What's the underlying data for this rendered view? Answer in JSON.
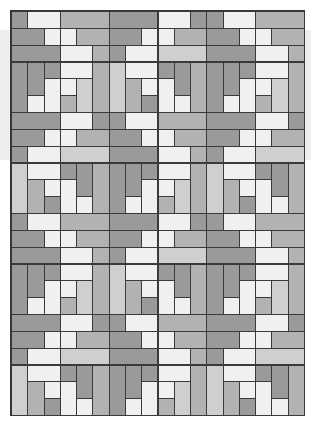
{
  "image": {
    "subject": "quilt pattern",
    "grid": {
      "columns": 18,
      "rows": 24
    },
    "palette": {
      "white": "#f0f0f0",
      "light": "#cfcfcf",
      "mid": "#b2b2b2",
      "dark": "#9a9a9a",
      "border": "#3a3a3a"
    },
    "block": {
      "columns": 6,
      "rows": 6,
      "pieces": [
        {
          "c": 0,
          "r": 0,
          "w": 1,
          "h": 1,
          "tone": "dark"
        },
        {
          "c": 1,
          "r": 0,
          "w": 2,
          "h": 1,
          "tone": "white"
        },
        {
          "c": 3,
          "r": 0,
          "w": 3,
          "h": 1,
          "tone": "mid"
        },
        {
          "c": 0,
          "r": 1,
          "w": 2,
          "h": 1,
          "tone": "dark"
        },
        {
          "c": 2,
          "r": 1,
          "w": 1,
          "h": 1,
          "tone": "white"
        },
        {
          "c": 3,
          "r": 1,
          "w": 1,
          "h": 1,
          "tone": "white"
        },
        {
          "c": 4,
          "r": 1,
          "w": 2,
          "h": 1,
          "tone": "mid"
        },
        {
          "c": 0,
          "r": 2,
          "w": 3,
          "h": 1,
          "tone": "dark"
        },
        {
          "c": 3,
          "r": 2,
          "w": 2,
          "h": 1,
          "tone": "white"
        },
        {
          "c": 5,
          "r": 2,
          "w": 1,
          "h": 1,
          "tone": "mid"
        },
        {
          "c": 0,
          "r": 3,
          "w": 1,
          "h": 3,
          "tone": "dark"
        },
        {
          "c": 1,
          "r": 3,
          "w": 1,
          "h": 2,
          "tone": "dark"
        },
        {
          "c": 2,
          "r": 3,
          "w": 1,
          "h": 1,
          "tone": "dark"
        },
        {
          "c": 3,
          "r": 3,
          "w": 2,
          "h": 1,
          "tone": "white"
        },
        {
          "c": 5,
          "r": 3,
          "w": 1,
          "h": 3,
          "tone": "mid"
        },
        {
          "c": 1,
          "r": 5,
          "w": 1,
          "h": 1,
          "tone": "white"
        },
        {
          "c": 2,
          "r": 4,
          "w": 1,
          "h": 2,
          "tone": "white"
        },
        {
          "c": 3,
          "r": 4,
          "w": 1,
          "h": 1,
          "tone": "white"
        },
        {
          "c": 3,
          "r": 5,
          "w": 1,
          "h": 1,
          "tone": "mid"
        },
        {
          "c": 4,
          "r": 4,
          "w": 1,
          "h": 2,
          "tone": "light"
        }
      ],
      "mirror_pieces": [
        {
          "c": 0,
          "r": 0,
          "w": 1,
          "h": 1,
          "tone": "dark"
        },
        {
          "c": 1,
          "r": 0,
          "w": 2,
          "h": 1,
          "tone": "white"
        },
        {
          "c": 3,
          "r": 0,
          "w": 3,
          "h": 1,
          "tone": "dark"
        },
        {
          "c": 0,
          "r": 1,
          "w": 2,
          "h": 1,
          "tone": "mid"
        },
        {
          "c": 2,
          "r": 1,
          "w": 1,
          "h": 1,
          "tone": "white"
        },
        {
          "c": 3,
          "r": 1,
          "w": 1,
          "h": 1,
          "tone": "white"
        },
        {
          "c": 4,
          "r": 1,
          "w": 2,
          "h": 1,
          "tone": "dark"
        },
        {
          "c": 0,
          "r": 2,
          "w": 3,
          "h": 1,
          "tone": "light"
        },
        {
          "c": 3,
          "r": 2,
          "w": 2,
          "h": 1,
          "tone": "white"
        },
        {
          "c": 5,
          "r": 2,
          "w": 1,
          "h": 1,
          "tone": "dark"
        },
        {
          "c": 0,
          "r": 3,
          "w": 1,
          "h": 3,
          "tone": "mid"
        },
        {
          "c": 1,
          "r": 3,
          "w": 1,
          "h": 2,
          "tone": "dark"
        },
        {
          "c": 2,
          "r": 3,
          "w": 1,
          "h": 1,
          "tone": "dark"
        },
        {
          "c": 3,
          "r": 3,
          "w": 2,
          "h": 1,
          "tone": "white"
        },
        {
          "c": 5,
          "r": 3,
          "w": 1,
          "h": 3,
          "tone": "light"
        },
        {
          "c": 1,
          "r": 5,
          "w": 1,
          "h": 1,
          "tone": "white"
        },
        {
          "c": 2,
          "r": 4,
          "w": 1,
          "h": 2,
          "tone": "white"
        },
        {
          "c": 3,
          "r": 4,
          "w": 1,
          "h": 1,
          "tone": "white"
        },
        {
          "c": 3,
          "r": 5,
          "w": 1,
          "h": 1,
          "tone": "dark"
        },
        {
          "c": 4,
          "r": 4,
          "w": 1,
          "h": 2,
          "tone": "mid"
        }
      ]
    }
  }
}
